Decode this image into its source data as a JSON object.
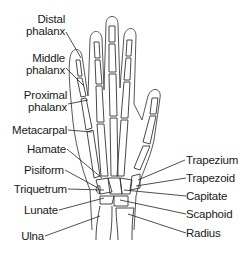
{
  "diagram": {
    "title": "",
    "labels_left": [
      {
        "id": "distal-phalanx",
        "line1": "Distal",
        "line2": "phalanx"
      },
      {
        "id": "middle-phalanx",
        "line1": "Middle",
        "line2": "phalanx"
      },
      {
        "id": "proximal-phalanx",
        "line1": "Proximal",
        "line2": "phalanx"
      },
      {
        "id": "metacarpal",
        "line1": "Metacarpal"
      },
      {
        "id": "hamate",
        "line1": "Hamate"
      },
      {
        "id": "pisiform",
        "line1": "Pisiform"
      },
      {
        "id": "triquetrum",
        "line1": "Triquetrum"
      },
      {
        "id": "lunate",
        "line1": "Lunate"
      },
      {
        "id": "ulna",
        "line1": "Ulna"
      }
    ],
    "labels_right": [
      {
        "id": "trapezium",
        "line1": "Trapezium"
      },
      {
        "id": "trapezoid",
        "line1": "Trapezoid"
      },
      {
        "id": "capitate",
        "line1": "Capitate"
      },
      {
        "id": "scaphoid",
        "line1": "Scaphoid"
      },
      {
        "id": "radius",
        "line1": "Radius"
      }
    ]
  }
}
